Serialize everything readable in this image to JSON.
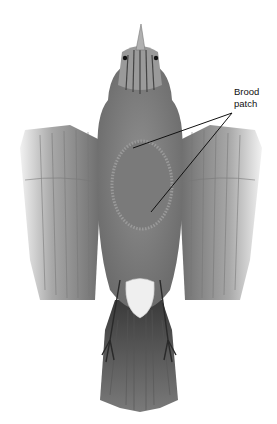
{
  "figure": {
    "annotation": {
      "label_line1": "Brood",
      "label_line2": "patch",
      "leader_apex": [
        232,
        113
      ],
      "leader_targets": [
        [
          133,
          148
        ],
        [
          151,
          212
        ]
      ]
    }
  },
  "colors": {
    "background": "#ffffff",
    "plumage_dark": "#4a4a4a",
    "plumage_mid": "#8a8a8a",
    "plumage_light": "#c8c8c8",
    "patch": "#7e7e7e",
    "leader_line": "#111111"
  }
}
